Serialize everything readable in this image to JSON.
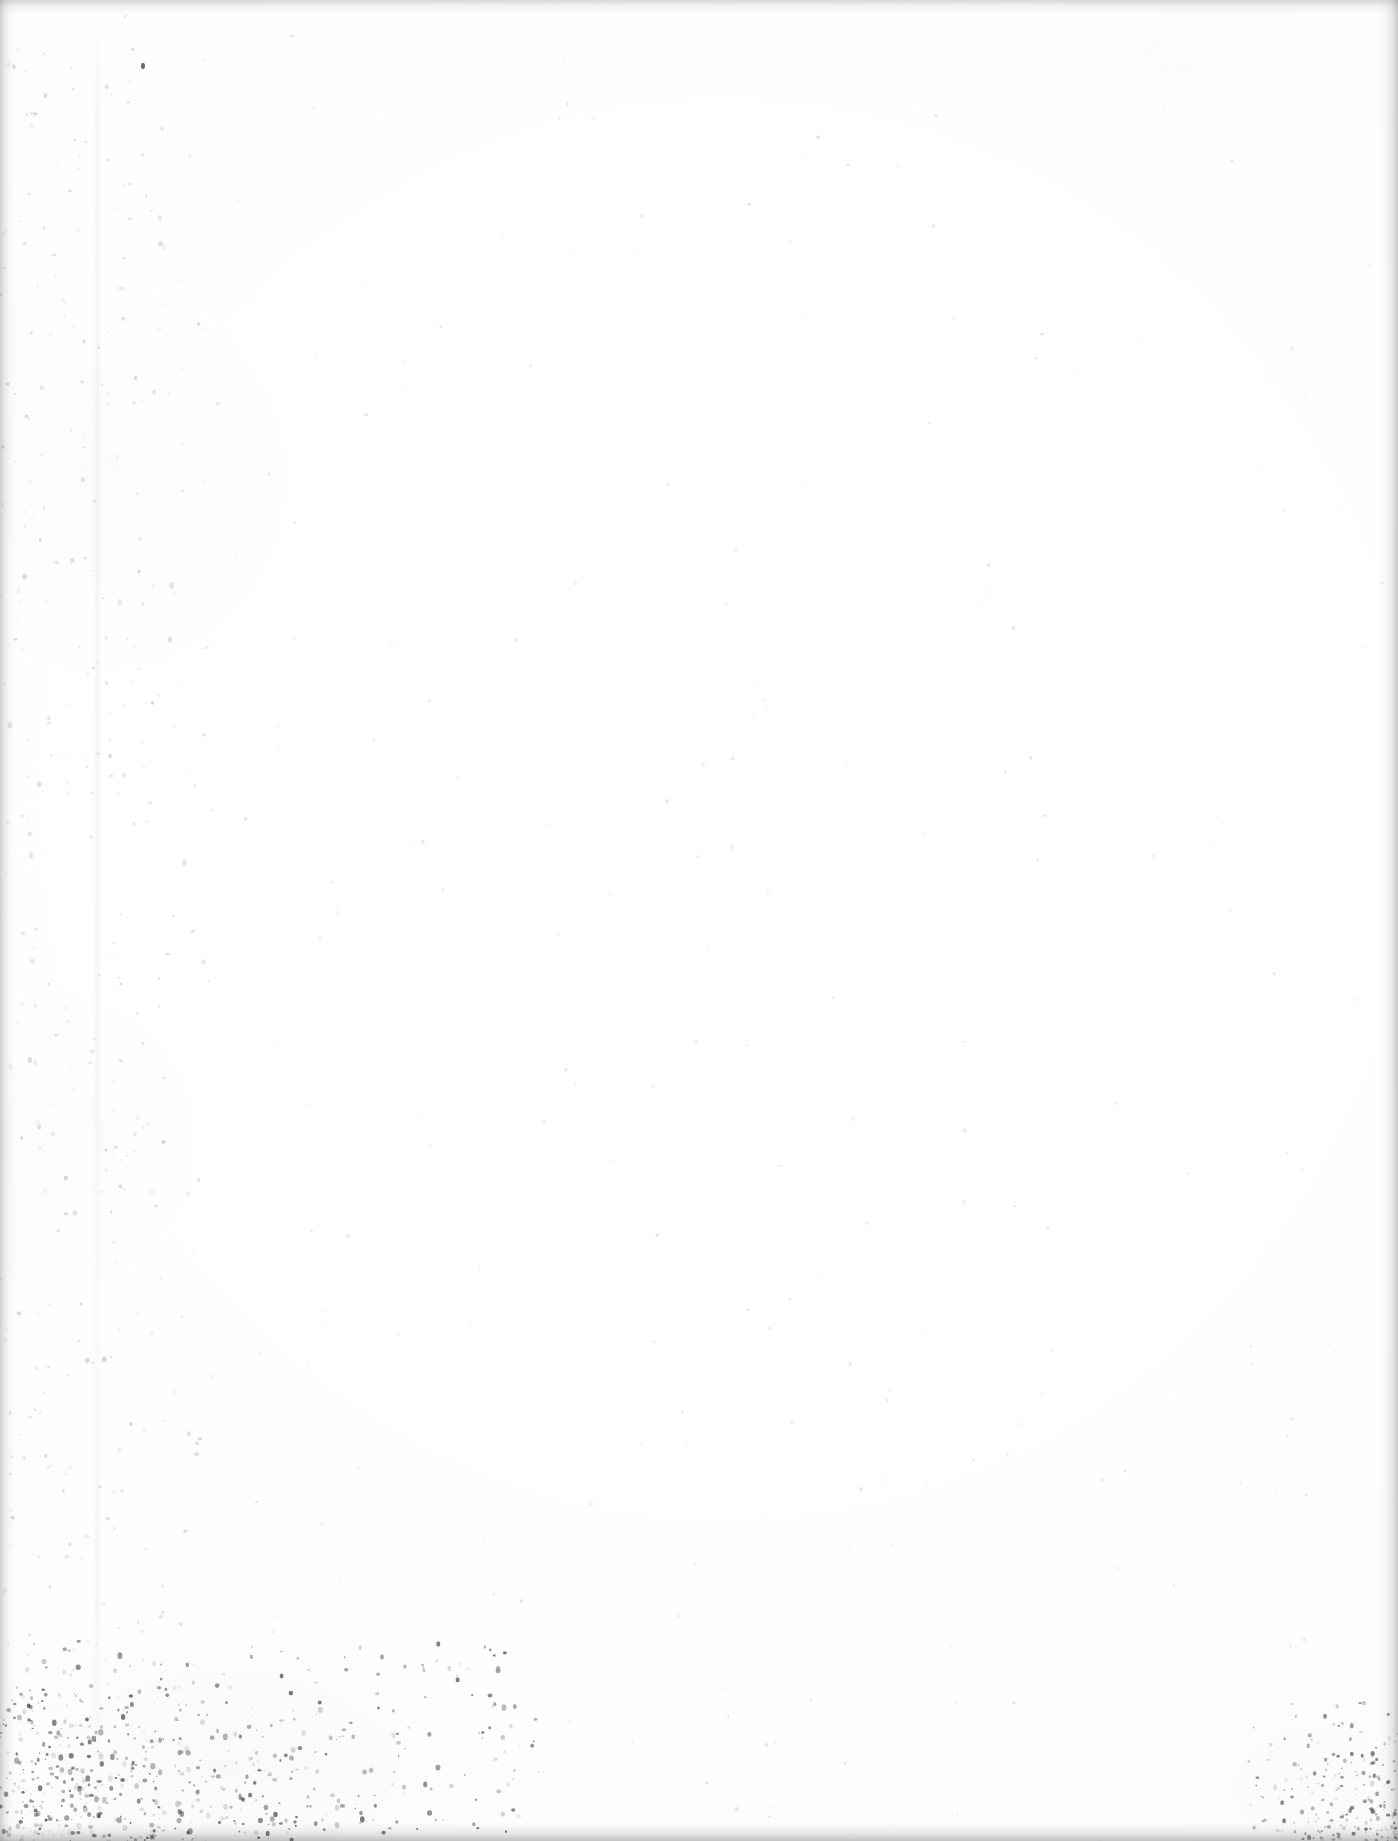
{
  "document": {
    "page_kind": "blank-scanned-page",
    "visible_text": "",
    "alt_text": "Blank scanned page — no printed text, figures, or markings",
    "width_px": 1398,
    "height_px": 1841
  },
  "appearance": {
    "paper_color": "#ffffff",
    "edge_shadow_color": "#76767a",
    "speckle_color": "#3a3a3e",
    "dust_color": "#9a9a9e"
  },
  "artifacts": {
    "edge_bands": [
      {
        "name": "left-edge-shadow",
        "label": "left edge shadow"
      },
      {
        "name": "top-edge-shadow",
        "label": "top edge shadow"
      },
      {
        "name": "right-edge-shadow",
        "label": "right edge shadow"
      },
      {
        "name": "bottom-edge-shadow",
        "label": "bottom edge shadow"
      }
    ],
    "speckle_clusters": [
      {
        "name": "bottom-left-speckle",
        "label": "dense speckle cluster, bottom-left corner"
      },
      {
        "name": "bottom-right-speckle",
        "label": "speckle cluster, bottom-right corner"
      },
      {
        "name": "left-margin-dust",
        "label": "scattered dust along left margin"
      },
      {
        "name": "page-dust",
        "label": "sparse dust specks across the page"
      }
    ],
    "streaks": [
      {
        "name": "gutter-streak",
        "label": "faint vertical scanner streak near left gutter"
      }
    ],
    "isolated_marks": [
      {
        "name": "speck-top-left",
        "label": "isolated dark speck near top-left"
      }
    ]
  }
}
